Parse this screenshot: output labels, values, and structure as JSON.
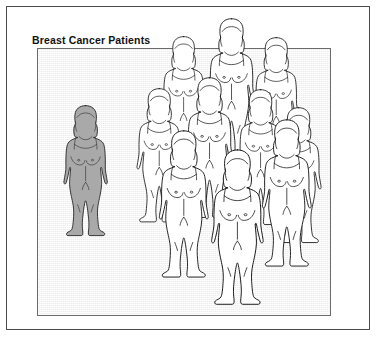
{
  "figure": {
    "title": "Breast Cancer Patients",
    "frame": {
      "outer_border_color": "#4a4a4a",
      "panel_border_color": "#6b6b6b",
      "panel_fill_color": "#ededed",
      "background_color": "#ffffff"
    }
  },
  "chart_data": {
    "type": "pictogram",
    "title": "Breast Cancer Patients",
    "subtitle": "",
    "xlabel": "",
    "ylabel": "",
    "icon": "female-body-silhouette",
    "unit_value": 1,
    "unit_label": "patient",
    "total_icons": 11,
    "categories": [
      "Highlighted patient",
      "Other patients"
    ],
    "values": [
      1,
      10
    ],
    "colors": [
      "#a9a9a9",
      "#ffffff"
    ],
    "legend_position": "none",
    "grid": false,
    "annotations": [],
    "figures": [
      {
        "id": "shaded-1",
        "group": "highlighted",
        "fill": "#a9a9a9",
        "row": "left",
        "x": 60,
        "y": 104,
        "scale": 0.8
      },
      {
        "id": "back-1",
        "group": "other",
        "fill": "#ffffff",
        "row": "back",
        "x": 158,
        "y": 35,
        "scale": 0.8
      },
      {
        "id": "back-2",
        "group": "other",
        "fill": "#ffffff",
        "row": "back",
        "x": 204,
        "y": 17,
        "scale": 0.86
      },
      {
        "id": "back-3",
        "group": "other",
        "fill": "#ffffff",
        "row": "back",
        "x": 250,
        "y": 36,
        "scale": 0.82
      },
      {
        "id": "middle-1",
        "group": "other",
        "fill": "#ffffff",
        "row": "middle",
        "x": 133,
        "y": 87,
        "scale": 0.82
      },
      {
        "id": "middle-2",
        "group": "other",
        "fill": "#ffffff",
        "row": "middle",
        "x": 182,
        "y": 76,
        "scale": 0.86
      },
      {
        "id": "middle-3",
        "group": "other",
        "fill": "#ffffff",
        "row": "middle",
        "x": 234,
        "y": 88,
        "scale": 0.83
      },
      {
        "id": "middle-4",
        "group": "other",
        "fill": "#ffffff",
        "row": "middle",
        "x": 272,
        "y": 106,
        "scale": 0.83
      },
      {
        "id": "front-1",
        "group": "other",
        "fill": "#ffffff",
        "row": "front",
        "x": 155,
        "y": 129,
        "scale": 0.9
      },
      {
        "id": "front-2",
        "group": "other",
        "fill": "#ffffff",
        "row": "front",
        "x": 207,
        "y": 148,
        "scale": 0.95
      },
      {
        "id": "front-3",
        "group": "other",
        "fill": "#ffffff",
        "row": "front",
        "x": 258,
        "y": 118,
        "scale": 0.9
      }
    ]
  }
}
